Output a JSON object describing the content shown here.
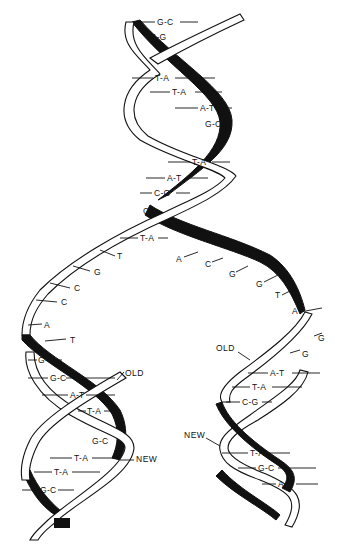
{
  "diagram": {
    "parent_helix": {
      "base_pairs": [
        "G-C",
        "C-G",
        "T-A",
        "T-A",
        "A-T",
        "G-C",
        "T-A",
        "A-T",
        "C-G",
        "C",
        "T-A"
      ]
    },
    "fork_unpaired": {
      "left_strand_bases": [
        "T",
        "G",
        "C",
        "C",
        "A",
        "T"
      ],
      "right_strand_bases": [
        "A",
        "C",
        "G",
        "G",
        "T",
        "A",
        "G",
        "G"
      ]
    },
    "left_daughter": {
      "base_pairs": [
        "G-C",
        "G-C",
        "A-T",
        "T-A",
        "G-C",
        "T-A",
        "T-A",
        "G-C"
      ],
      "old_label": "OLD",
      "new_label": "NEW"
    },
    "right_daughter": {
      "base_pairs": [
        "A-T",
        "T-A",
        "C-G",
        "T-A",
        "G-C",
        "A-T"
      ],
      "old_label": "OLD",
      "new_label": "NEW"
    }
  }
}
